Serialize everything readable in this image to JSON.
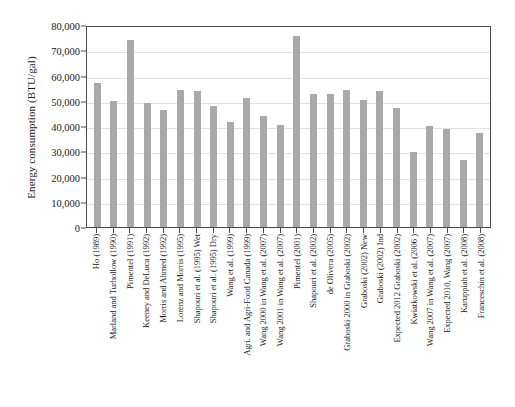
{
  "chart_data": {
    "type": "bar",
    "title": "",
    "xlabel": "",
    "ylabel": "Energy consumption (BTU/gal)",
    "ylim": [
      0,
      80000
    ],
    "ytick_labels": [
      "0",
      "10,000",
      "20,000",
      "30,000",
      "40,000",
      "50,000",
      "60,000",
      "70,000",
      "80,000"
    ],
    "ytick_values": [
      0,
      10000,
      20000,
      30000,
      40000,
      50000,
      60000,
      70000,
      80000
    ],
    "grid": "horizontal",
    "legend": "none",
    "bar_color": "#a9a9a9",
    "categories": [
      "Ho (1989)",
      "Marland and Turhollow (1990)",
      "Pimentel (1991)",
      "Keeney and DeLuca (1992)",
      "Morris and Ahmed (1992)",
      "Lorenz and Morris (1995)",
      "Shapouri et al. (1995) Wet",
      "Shapouri et al. (1995) Dry",
      "Wang et al. (1999)",
      "Agri. and Agri-Food Canada (1999)",
      "Wang 2000 in Wang et al. (2007)",
      "Wang 2001 in Wang et al. (2007)",
      "Pimentel (2001)",
      "Shapouri et al. (2002)",
      "de Olivera (2005)",
      "Graboski 2000 in Graboski (2002)",
      "Graboski (2002) New",
      "Graboski (2002) Ind",
      "Expected 2012 Graboski (2002)",
      "Kwiatkowski et al. (2006 )",
      "Wang 2007 in Wang et al. (2007)",
      "Expected 2010, Wang (2007)",
      "Karuppiah et al. (2008)",
      "Franceschin et al. (2008)"
    ],
    "values": [
      57000,
      50000,
      74000,
      49000,
      46500,
      54200,
      53700,
      48000,
      41400,
      51000,
      44000,
      40500,
      75500,
      52500,
      52500,
      54200,
      50500,
      53800,
      47000,
      29800,
      40200,
      39000,
      26700,
      37300
    ]
  }
}
